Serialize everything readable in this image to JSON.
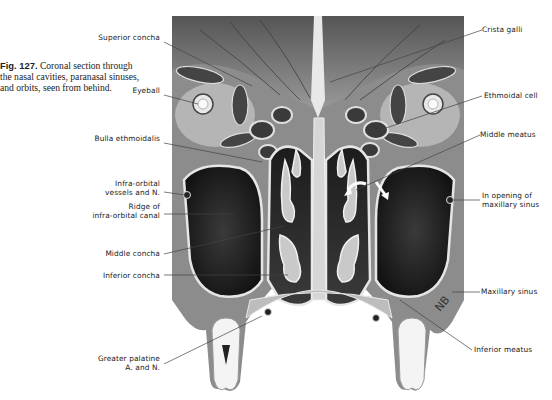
{
  "figure": {
    "number": "Fig. 127.",
    "caption": "Coronal section through the nasal cavities, paranasal sinuses, and orbits, seen from behind.",
    "signature": "NB"
  },
  "labels_left": [
    {
      "text": "Superior concha"
    },
    {
      "text": "Eyeball"
    },
    {
      "text": "Bulla ethmoidalis"
    },
    {
      "text": "Infra-orbital",
      "text2": "vessels and N."
    },
    {
      "text": "Ridge of",
      "text2": "infra-orbital canal"
    },
    {
      "text": "Middle concha"
    },
    {
      "text": "Inferior concha"
    },
    {
      "text": "Greater palatine",
      "text2": "A. and N."
    }
  ],
  "labels_right": [
    {
      "text": "Crista galli"
    },
    {
      "text": "Ethmoidal cell"
    },
    {
      "text": "Middle meatus"
    },
    {
      "text": "In opening of",
      "text2": "maxillary sinus"
    },
    {
      "text": "Maxillary sinus"
    },
    {
      "text": "Inferior meatus"
    }
  ],
  "colors": {
    "background": "#ffffff",
    "text": "#222222",
    "leader_line": "#444444",
    "tissue_dark": "#2a2a2a",
    "tissue_mid": "#7a7a7a",
    "bone_light": "#d8d8d8"
  }
}
